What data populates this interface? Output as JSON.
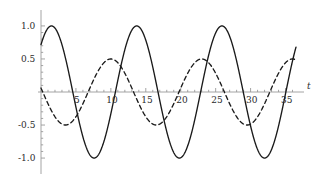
{
  "figure": {
    "background_color": "#ffffff",
    "axis_color": "#9a9a9a",
    "curve_color": "#1a1a1a",
    "tick_label_color": "#2b2b2b"
  },
  "axes": {
    "x_axis_label": "t",
    "y_axis_label": "",
    "x_tick_labels": [
      "5",
      "10",
      "15",
      "20",
      "25",
      "30",
      "35"
    ],
    "x_tick_values": [
      5,
      10,
      15,
      20,
      25,
      30,
      35
    ],
    "y_tick_labels": [
      "1.0",
      "0.5",
      "-0.5",
      "-1.0"
    ],
    "y_tick_values": [
      1.0,
      0.5,
      -0.5,
      -1.0
    ],
    "x_min": 0,
    "x_max": 36.5,
    "y_min": -1.12,
    "y_max": 1.12,
    "minor_ticks_per_interval": 5
  },
  "chart_data": {
    "type": "line",
    "title": "",
    "xlabel": "t",
    "ylabel": "",
    "xlim": [
      0,
      36.5
    ],
    "ylim": [
      -1.12,
      1.12
    ],
    "grid": false,
    "legend": "none",
    "x_ticks": [
      5,
      10,
      15,
      20,
      25,
      30,
      35
    ],
    "y_ticks": [
      -1.0,
      -0.5,
      0.5,
      1.0
    ],
    "series": [
      {
        "name": "solid-wave",
        "style": "solid",
        "color": "#1a1a1a",
        "amplitude": 1.0,
        "period": 12.2,
        "phase_deg": 60,
        "formula": "cos(2*pi*(t-1.5)/12.2)",
        "value_at_x0": 0.87,
        "maxima_x": [
          1.5,
          13.7,
          25.9
        ],
        "maxima_y": [
          1.0,
          1.0,
          1.0
        ],
        "minima_x": [
          7.6,
          19.8,
          32.0
        ],
        "minima_y": [
          -1.0,
          -1.0,
          -1.0
        ],
        "x": [
          0,
          1.5,
          4.6,
          7.6,
          10.7,
          13.7,
          16.8,
          19.8,
          22.9,
          25.9,
          29.0,
          32.0,
          35.1,
          36.5
        ],
        "y": [
          0.87,
          1.0,
          0.0,
          -1.0,
          0.0,
          1.0,
          0.0,
          -1.0,
          0.0,
          1.0,
          0.0,
          -1.0,
          0.0,
          0.25
        ]
      },
      {
        "name": "dashed-wave",
        "style": "dashed",
        "color": "#1a1a1a",
        "amplitude": 0.5,
        "period": 13.0,
        "phase_deg": 30,
        "formula": "0.5*cos(2*pi*(t-10.0)/13.0)",
        "value_at_x0": 0.25,
        "maxima_x": [
          10.0,
          23.0,
          36.0
        ],
        "maxima_y": [
          0.5,
          0.5,
          0.5
        ],
        "minima_x": [
          3.5,
          16.5,
          29.5
        ],
        "minima_y": [
          -0.5,
          -0.5,
          -0.5
        ],
        "x": [
          0,
          3.5,
          6.75,
          10.0,
          13.25,
          16.5,
          19.75,
          23.0,
          26.25,
          29.5,
          32.75,
          36.0,
          36.5
        ],
        "y": [
          0.25,
          -0.5,
          0.0,
          0.5,
          0.0,
          -0.5,
          0.0,
          0.5,
          0.0,
          -0.5,
          0.0,
          0.5,
          0.49
        ]
      }
    ]
  }
}
